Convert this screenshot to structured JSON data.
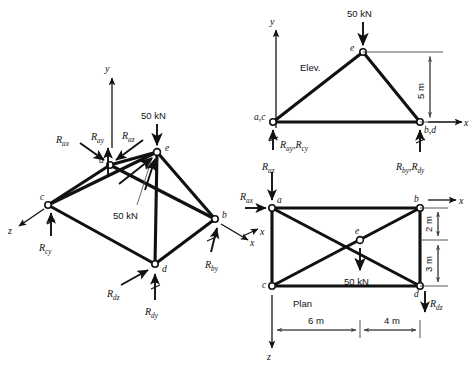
{
  "figure": {
    "background_color": "#ffffff",
    "ink_color": "#111111",
    "views": [
      {
        "id": "iso",
        "label": ""
      },
      {
        "id": "elev",
        "label": "Elev."
      },
      {
        "id": "plan",
        "label": "Plan"
      }
    ]
  },
  "iso": {
    "nodes": {
      "a": "a",
      "b": "b",
      "c": "c",
      "d": "d",
      "e": "e"
    },
    "axes": {
      "y": "y",
      "x": "x",
      "z": "z"
    },
    "load_top": "50 kN",
    "load_leader": "50 kN",
    "reactions": {
      "ax": {
        "base": "R",
        "sub": "ax"
      },
      "ay": {
        "base": "R",
        "sub": "ay"
      },
      "az": {
        "base": "R",
        "sub": "az"
      },
      "cy": {
        "base": "R",
        "sub": "cy"
      },
      "by": {
        "base": "R",
        "sub": "by"
      },
      "dy": {
        "base": "R",
        "sub": "dy"
      },
      "dz": {
        "base": "R",
        "sub": "dz"
      }
    }
  },
  "elev": {
    "title": "Elev.",
    "nodes": {
      "ac": "a,c",
      "bd": "b,d",
      "e": "e"
    },
    "axes": {
      "y": "y",
      "x": "x"
    },
    "load": "50 kN",
    "dimension_height": "5 m",
    "reactions": {
      "left": [
        {
          "base": "R",
          "sub": "ay"
        },
        {
          "base": "R",
          "sub": "cy"
        }
      ],
      "right": [
        {
          "base": "R",
          "sub": "by"
        },
        {
          "base": "R",
          "sub": "dy"
        }
      ],
      "az": {
        "base": "R",
        "sub": "az"
      }
    }
  },
  "plan": {
    "title": "Plan",
    "nodes": {
      "a": "a",
      "b": "b",
      "c": "c",
      "d": "d",
      "e": "e"
    },
    "axes": {
      "x_right": "x",
      "x_left": "x",
      "z": "z"
    },
    "load": "50 kN",
    "dimensions": {
      "left_span": "6 m",
      "right_span": "4 m",
      "top_offset": "2 m",
      "bottom_offset": "3 m"
    },
    "reactions": {
      "ax": {
        "base": "R",
        "sub": "ax"
      },
      "az": {
        "base": "R",
        "sub": "az"
      },
      "dz": {
        "base": "R",
        "sub": "dz"
      }
    }
  }
}
